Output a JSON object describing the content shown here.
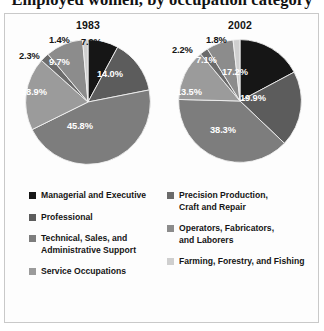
{
  "title": "Employed women, by occupation category",
  "legend": {
    "column1": [
      {
        "label_line1": "Managerial and Executive",
        "label_line2": "",
        "color": "#161616",
        "name": "managerial-and-executive"
      },
      {
        "label_line1": "Professional",
        "label_line2": "",
        "color": "#5c5c5c",
        "name": "professional"
      },
      {
        "label_line1": "Technical, Sales, and",
        "label_line2": "Administrative Support",
        "color": "#7d7d7d",
        "name": "technical-sales-and-administrative-support"
      },
      {
        "label_line1": "Service Occupations",
        "label_line2": "",
        "color": "#9b9b9b",
        "name": "service-occupations"
      }
    ],
    "column2": [
      {
        "label_line1": "Precision Production,",
        "label_line2": "Craft and Repair",
        "color": "#6b6b6b",
        "name": "precision-production-craft-and-repair"
      },
      {
        "label_line1": "Operators, Fabricators,",
        "label_line2": "and Laborers",
        "color": "#8c8c8c",
        "name": "operators-fabricators-and-laborers"
      },
      {
        "label_line1": "Farming, Forestry, and Fishing",
        "label_line2": "",
        "color": "#cfcfcf",
        "name": "farming-forestry-and-fishing"
      }
    ]
  },
  "chart_data": [
    {
      "type": "pie",
      "title": "1983",
      "categories": [
        "Managerial and Executive",
        "Professional",
        "Technical, Sales, and Administrative Support",
        "Service Occupations",
        "Precision Production, Craft and Repair",
        "Operators, Fabricators, and Laborers",
        "Farming, Forestry, and Fishing"
      ],
      "values": [
        7.9,
        14.0,
        45.8,
        18.9,
        2.3,
        9.7,
        1.4
      ],
      "labels": [
        "7.9%",
        "14.0%",
        "45.8%",
        "18.9%",
        "2.3%",
        "9.7%",
        "1.4%"
      ],
      "colors": [
        "#161616",
        "#5c5c5c",
        "#7d7d7d",
        "#9b9b9b",
        "#6b6b6b",
        "#8c8c8c",
        "#cfcfcf"
      ],
      "units": "percent",
      "legend_position": "bottom"
    },
    {
      "type": "pie",
      "title": "2002",
      "categories": [
        "Managerial and Executive",
        "Professional",
        "Technical, Sales, and Administrative Support",
        "Service Occupations",
        "Precision Production, Craft and Repair",
        "Operators, Fabricators, and Laborers",
        "Farming, Forestry, and Fishing"
      ],
      "values": [
        17.2,
        19.9,
        38.3,
        13.5,
        2.2,
        7.1,
        1.8
      ],
      "labels": [
        "17.2%",
        "19.9%",
        "38.3%",
        "13.5%",
        "2.2%",
        "7.1%",
        "1.8%"
      ],
      "colors": [
        "#161616",
        "#5c5c5c",
        "#7d7d7d",
        "#9b9b9b",
        "#6b6b6b",
        "#8c8c8c",
        "#cfcfcf"
      ],
      "units": "percent",
      "legend_position": "bottom"
    }
  ]
}
